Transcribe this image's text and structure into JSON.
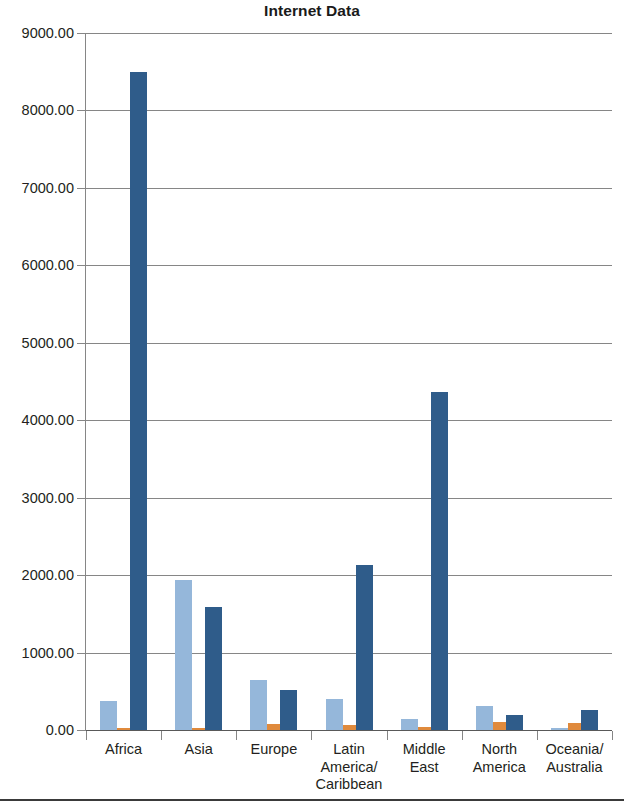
{
  "chart_data": {
    "type": "bar",
    "title": "Internet Data",
    "xlabel": "",
    "ylabel": "",
    "ylim": [
      0,
      9000
    ],
    "ytick_step": 1000,
    "ytick_labels": [
      "9000.00",
      "8000.00",
      "7000.00",
      "6000.00",
      "5000.00",
      "4000.00",
      "3000.00",
      "2000.00",
      "1000.00",
      "0.00"
    ],
    "grid": true,
    "legend": "none",
    "categories": [
      "Africa",
      "Asia",
      "Europe",
      "Latin\nAmerica/\nCaribbean",
      "Middle\nEast",
      "North\nAmerica",
      "Oceania/\nAustralia"
    ],
    "series": [
      {
        "name": "series-1",
        "color": "#95b7da",
        "values": [
          380,
          1940,
          650,
          400,
          140,
          310,
          25
        ]
      },
      {
        "name": "series-2",
        "color": "#e08a3c",
        "values": [
          20,
          30,
          80,
          60,
          40,
          100,
          90
        ]
      },
      {
        "name": "series-3",
        "color": "#2f5c8a",
        "values": [
          8500,
          1590,
          520,
          2130,
          4370,
          190,
          260
        ]
      }
    ]
  },
  "colors": {
    "series_light_blue": "#95b7da",
    "series_orange": "#e08a3c",
    "series_dark_blue": "#2f5c8a",
    "gridline": "#868686",
    "axis": "#595959",
    "text": "#231f20"
  }
}
